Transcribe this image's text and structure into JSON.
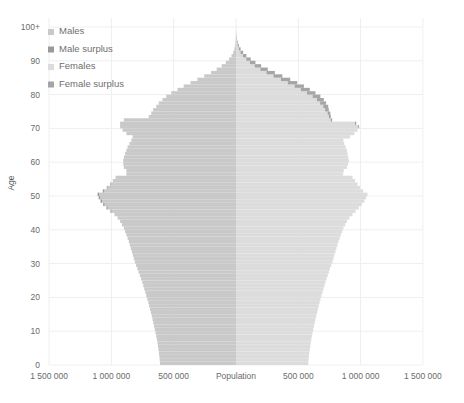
{
  "chart_data": {
    "type": "bar",
    "subtype": "population-pyramid",
    "title": "",
    "xlabel": "Population",
    "ylabel": "Age",
    "grid": true,
    "legend_position": "top-left",
    "x_max": 1500000,
    "x_ticks_left": [
      "1 500 000",
      "1 000 000",
      "500 000"
    ],
    "x_tick_center": "Population",
    "x_ticks_right": [
      "500 000",
      "1 000 000",
      "1 500 000"
    ],
    "x_tick_values": [
      1500000,
      1000000,
      500000,
      0,
      500000,
      1000000,
      1500000
    ],
    "y_ticks": [
      "0",
      "10",
      "20",
      "30",
      "40",
      "50",
      "60",
      "70",
      "80",
      "90",
      "100+"
    ],
    "y_tick_values": [
      0,
      10,
      20,
      30,
      40,
      50,
      60,
      70,
      80,
      90,
      100
    ],
    "ylim": [
      0,
      100
    ],
    "legend": [
      {
        "label": "Males",
        "color": "#c9c9c9"
      },
      {
        "label": "Male surplus",
        "color": "#9a9a9a"
      },
      {
        "label": "Females",
        "color": "#dcdcdc"
      },
      {
        "label": "Female surplus",
        "color": "#a5a5a5"
      }
    ],
    "colors": {
      "males": "#c9c9c9",
      "male_surplus": "#9a9a9a",
      "females": "#dcdcdc",
      "female_surplus": "#a5a5a5",
      "grid": "#eceff1",
      "text": "#6a6a6a"
    },
    "ages": [
      0,
      1,
      2,
      3,
      4,
      5,
      6,
      7,
      8,
      9,
      10,
      11,
      12,
      13,
      14,
      15,
      16,
      17,
      18,
      19,
      20,
      21,
      22,
      23,
      24,
      25,
      26,
      27,
      28,
      29,
      30,
      31,
      32,
      33,
      34,
      35,
      36,
      37,
      38,
      39,
      40,
      41,
      42,
      43,
      44,
      45,
      46,
      47,
      48,
      49,
      50,
      51,
      52,
      53,
      54,
      55,
      56,
      57,
      58,
      59,
      60,
      61,
      62,
      63,
      64,
      65,
      66,
      67,
      68,
      69,
      70,
      71,
      72,
      73,
      74,
      75,
      76,
      77,
      78,
      79,
      80,
      81,
      82,
      83,
      84,
      85,
      86,
      87,
      88,
      89,
      90,
      91,
      92,
      93,
      94,
      95,
      96,
      97,
      98,
      99,
      100
    ],
    "series": [
      {
        "name": "Males",
        "side": "left",
        "values": [
          610000,
          612000,
          615000,
          618000,
          622000,
          626000,
          630000,
          635000,
          640000,
          646000,
          652000,
          658000,
          664000,
          670000,
          676000,
          683000,
          690000,
          697000,
          704000,
          712000,
          720000,
          728000,
          736000,
          744000,
          752000,
          762000,
          772000,
          782000,
          792000,
          802000,
          812000,
          820000,
          828000,
          836000,
          844000,
          852000,
          860000,
          870000,
          880000,
          890000,
          900000,
          915000,
          930000,
          950000,
          975000,
          1000000,
          1030000,
          1055000,
          1075000,
          1090000,
          1100000,
          1060000,
          1030000,
          1005000,
          985000,
          965000,
          880000,
          880000,
          900000,
          905000,
          905000,
          900000,
          890000,
          880000,
          870000,
          855000,
          840000,
          830000,
          880000,
          910000,
          930000,
          930000,
          900000,
          700000,
          680000,
          665000,
          640000,
          620000,
          590000,
          560000,
          520000,
          470000,
          420000,
          365000,
          310000,
          255000,
          200000,
          155000,
          115000,
          82000,
          56000,
          36000,
          22000,
          13000,
          7000,
          3600,
          1700,
          760,
          300,
          110,
          40,
          12
        ]
      },
      {
        "name": "Males total",
        "side": "left",
        "note": "total male bar = Males + Male surplus where surplus > 0",
        "male_surplus": [
          0,
          0,
          0,
          0,
          0,
          0,
          0,
          0,
          0,
          0,
          0,
          0,
          0,
          0,
          0,
          0,
          0,
          0,
          0,
          0,
          0,
          0,
          0,
          0,
          0,
          0,
          0,
          0,
          0,
          0,
          0,
          0,
          0,
          0,
          0,
          0,
          0,
          0,
          0,
          0,
          0,
          0,
          0,
          0,
          0,
          8000,
          10000,
          11000,
          12000,
          12000,
          11000,
          9000,
          7000,
          5000,
          3000,
          1000,
          0,
          0,
          0,
          0,
          0,
          0,
          0,
          0,
          0,
          0,
          0,
          0,
          0,
          0,
          0,
          0,
          0,
          0,
          0,
          0,
          0,
          0,
          0,
          0,
          0,
          0,
          0,
          0,
          0,
          0,
          0,
          0,
          0,
          0,
          0,
          0,
          0,
          0,
          0,
          0,
          0,
          0,
          0,
          0,
          0,
          0,
          0,
          0,
          0
        ]
      },
      {
        "name": "Females",
        "side": "right",
        "values": [
          580000,
          582000,
          585000,
          588000,
          592000,
          596000,
          600000,
          604000,
          609000,
          614000,
          620000,
          626000,
          632000,
          638000,
          644000,
          650000,
          657000,
          664000,
          671000,
          678000,
          686000,
          694000,
          702000,
          710000,
          718000,
          727000,
          736000,
          745000,
          754000,
          764000,
          774000,
          782000,
          790000,
          798000,
          806000,
          814000,
          822000,
          832000,
          842000,
          852000,
          862000,
          876000,
          890000,
          910000,
          935000,
          960000,
          985000,
          1010000,
          1030000,
          1045000,
          1055000,
          1020000,
          995000,
          975000,
          955000,
          935000,
          860000,
          865000,
          890000,
          900000,
          905000,
          900000,
          895000,
          890000,
          880000,
          868000,
          862000,
          915000,
          950000,
          975000,
          980000,
          955000,
          760000,
          745000,
          735000,
          715000,
          700000,
          675000,
          650000,
          615000,
          570000,
          520000,
          470000,
          415000,
          360000,
          300000,
          245000,
          195000,
          150000,
          112000,
          82000,
          56000,
          36000,
          22000,
          13000,
          7200,
          3700,
          1800,
          820,
          330,
          120,
          42
        ]
      },
      {
        "name": "Female surplus",
        "side": "right",
        "values": [
          0,
          0,
          0,
          0,
          0,
          0,
          0,
          0,
          0,
          0,
          0,
          0,
          0,
          0,
          0,
          0,
          0,
          0,
          0,
          0,
          0,
          0,
          0,
          0,
          0,
          0,
          0,
          0,
          0,
          0,
          0,
          0,
          0,
          0,
          0,
          0,
          0,
          0,
          0,
          0,
          0,
          0,
          0,
          0,
          0,
          0,
          0,
          0,
          0,
          0,
          0,
          0,
          0,
          0,
          0,
          0,
          0,
          0,
          0,
          0,
          0,
          0,
          0,
          0,
          0,
          0,
          0,
          0,
          0,
          0,
          8000,
          10000,
          12000,
          16000,
          22000,
          30000,
          40000,
          48000,
          55000,
          62000,
          68000,
          72000,
          75000,
          76000,
          75000,
          72000,
          67000,
          60000,
          52000,
          44000,
          36000,
          28000,
          21000,
          15000,
          10000,
          6200,
          3500,
          1800,
          840,
          350,
          130
        ]
      }
    ]
  }
}
